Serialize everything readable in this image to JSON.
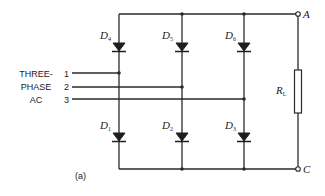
{
  "figure": {
    "caption": "(a)",
    "input_label": [
      "THREE-",
      "PHASE",
      "AC"
    ],
    "phases": [
      {
        "number": "1"
      },
      {
        "number": "2"
      },
      {
        "number": "3"
      }
    ],
    "diodes_upper": [
      {
        "letter": "D",
        "sub": "4"
      },
      {
        "letter": "D",
        "sub": "5"
      },
      {
        "letter": "D",
        "sub": "6"
      }
    ],
    "diodes_lower": [
      {
        "letter": "D",
        "sub": "1"
      },
      {
        "letter": "D",
        "sub": "2"
      },
      {
        "letter": "D",
        "sub": "3"
      }
    ],
    "load": {
      "letter": "R",
      "sub": "L"
    },
    "terminals": {
      "top": "A",
      "bottom": "C"
    },
    "colors": {
      "line": "#2a2a2a",
      "background": "#ffffff"
    }
  }
}
